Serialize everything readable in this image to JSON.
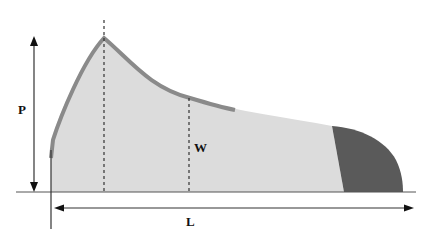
{
  "diagram": {
    "labels": {
      "p": "P",
      "w": "W",
      "l": "L"
    },
    "colors": {
      "light_fill": "#dcdcdc",
      "dark_fill": "#5a5a5a",
      "outline": "#8a8a8a",
      "axis": "#222222"
    }
  }
}
